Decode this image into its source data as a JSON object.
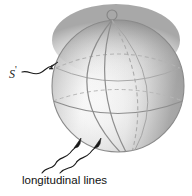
{
  "figure": {
    "kind": "sphere-diagram",
    "background_color": "#ffffff",
    "sphere": {
      "center_x": 118,
      "center_y": 86,
      "radius": 66,
      "outline_color": "#8a8a8a",
      "shade_light": "#ffffff",
      "shade_mid": "#d6d6d6",
      "shade_dark": "#8f8f8f",
      "highlight_x": 100,
      "highlight_y": 104,
      "pole_marker": {
        "name": "north-pole-marker",
        "cx": 112,
        "cy": 15,
        "r": 5,
        "fill": "#ffffff",
        "stroke": "#6f6f6f"
      }
    },
    "grid": {
      "line_color_front": "#8e8e8e",
      "line_color_back": "#b0b0b0",
      "dash_pattern": "4 3",
      "longitude_count": 4,
      "latitude_count": 2
    },
    "labels": {
      "surface_label": "S",
      "surface_label_prime": "'",
      "longitudinal_label": "longitudinal lines"
    },
    "annotations": {
      "s_leader_name": "s-leader-arrow",
      "long_leader_left_name": "longitudinal-leader-arrow-left",
      "long_leader_right_name": "longitudinal-leader-arrow-right",
      "leader_color": "#1a1a1a"
    }
  }
}
